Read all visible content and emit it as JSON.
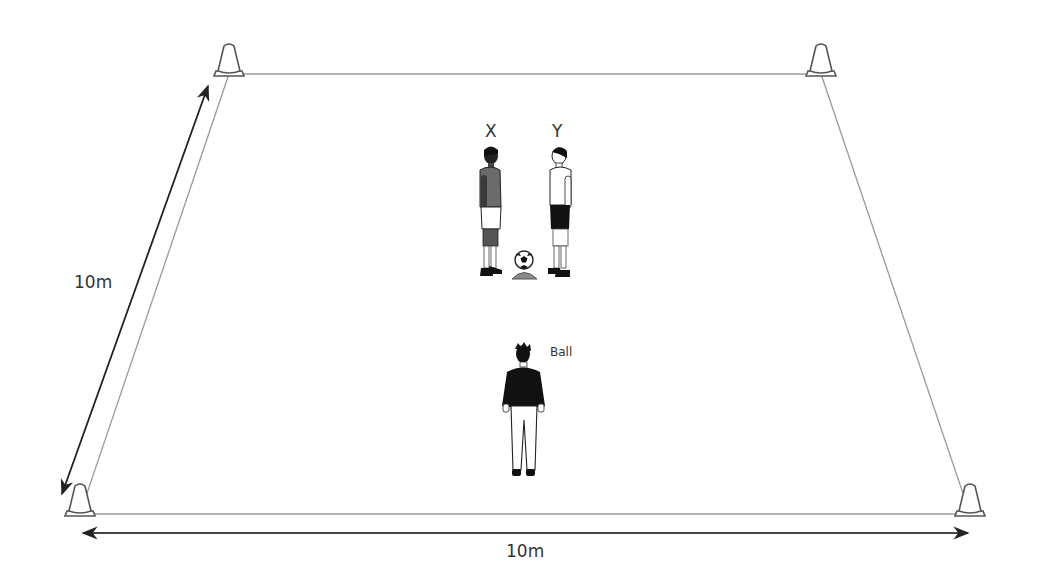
{
  "diagram": {
    "type": "training-drill-setup",
    "pitch": {
      "shape": "trapezoid-perspective",
      "corners": [
        {
          "name": "top-left",
          "x": 229,
          "y": 74
        },
        {
          "name": "top-right",
          "x": 821,
          "y": 74
        },
        {
          "name": "bottom-right",
          "x": 970,
          "y": 514
        },
        {
          "name": "bottom-left",
          "x": 80,
          "y": 514
        }
      ],
      "line_color": "#999999"
    },
    "cones": [
      {
        "id": "cone-top-left",
        "x": 229,
        "y": 74
      },
      {
        "id": "cone-top-right",
        "x": 821,
        "y": 74
      },
      {
        "id": "cone-bottom-left",
        "x": 80,
        "y": 514
      },
      {
        "id": "cone-bottom-right",
        "x": 970,
        "y": 514
      }
    ],
    "dimensions": {
      "side": {
        "label": "10m",
        "from": [
          208,
          86
        ],
        "to": [
          62,
          494
        ]
      },
      "bottom": {
        "label": "10m",
        "from": [
          83,
          533
        ],
        "to": [
          968,
          533
        ]
      }
    },
    "players": [
      {
        "id": "X",
        "label": "X",
        "kit": "dark shirt, white shorts",
        "facing": "right",
        "x": 490,
        "y": 148
      },
      {
        "id": "Y",
        "label": "Y",
        "kit": "white shirt, dark shorts",
        "facing": "left",
        "x": 560,
        "y": 148
      },
      {
        "id": "server",
        "label": "Ball",
        "kit": "black top, white trousers",
        "facing": "front",
        "x": 524,
        "y": 345
      }
    ],
    "ball": {
      "on_cone": true,
      "x": 524,
      "y": 262
    },
    "labels": {
      "side_dimension": "10m",
      "bottom_dimension": "10m",
      "player_x": "X",
      "player_y": "Y",
      "server": "Ball"
    }
  }
}
